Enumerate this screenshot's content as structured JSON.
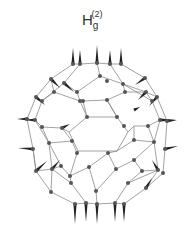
{
  "figure": {
    "title": {
      "base": "H",
      "subscript": "g",
      "superscript": "(2)"
    },
    "molecule": "C60 fullerene vibrational mode",
    "colors": {
      "bond": "#8a8a8a",
      "atom": "#555555",
      "arrow": "#222222",
      "text": "#333333"
    },
    "atoms": [
      [
        73,
        64
      ],
      [
        80,
        64
      ],
      [
        97,
        63
      ],
      [
        110,
        64
      ],
      [
        121,
        64
      ],
      [
        100,
        76
      ],
      [
        51,
        79
      ],
      [
        64,
        83
      ],
      [
        77,
        92
      ],
      [
        107,
        81
      ],
      [
        123,
        84
      ],
      [
        145,
        78
      ],
      [
        36,
        97
      ],
      [
        42,
        101
      ],
      [
        54,
        92
      ],
      [
        80,
        101
      ],
      [
        125,
        92
      ],
      [
        146,
        92
      ],
      [
        157,
        97
      ],
      [
        152,
        101
      ],
      [
        87,
        117
      ],
      [
        117,
        117
      ],
      [
        107,
        100
      ],
      [
        83,
        101
      ],
      [
        27,
        119
      ],
      [
        35,
        120
      ],
      [
        42,
        127
      ],
      [
        62,
        128
      ],
      [
        124,
        126
      ],
      [
        148,
        126
      ],
      [
        160,
        120
      ],
      [
        167,
        121
      ],
      [
        33,
        149
      ],
      [
        49,
        143
      ],
      [
        72,
        141
      ],
      [
        77,
        153
      ],
      [
        108,
        153
      ],
      [
        134,
        140
      ],
      [
        154,
        142
      ],
      [
        165,
        149
      ],
      [
        36,
        171
      ],
      [
        52,
        169
      ],
      [
        70,
        176
      ],
      [
        89,
        167
      ],
      [
        116,
        169
      ],
      [
        142,
        171
      ],
      [
        158,
        170
      ],
      [
        51,
        192
      ],
      [
        71,
        183
      ],
      [
        96,
        191
      ],
      [
        128,
        183
      ],
      [
        146,
        188
      ],
      [
        163,
        173
      ],
      [
        75,
        204
      ],
      [
        86,
        203
      ],
      [
        97,
        204
      ],
      [
        115,
        203
      ],
      [
        124,
        204
      ],
      [
        61,
        166
      ],
      [
        134,
        160
      ]
    ],
    "bonds_ring_hex_center": [
      [
        87,
        117
      ],
      [
        117,
        117
      ],
      [
        128,
        132
      ],
      [
        117,
        151
      ],
      [
        78,
        151
      ],
      [
        69,
        132
      ]
    ],
    "arrows": [
      [
        73,
        64,
        73,
        48
      ],
      [
        80,
        64,
        80,
        50
      ],
      [
        97,
        63,
        97,
        45
      ],
      [
        110,
        64,
        110,
        50
      ],
      [
        121,
        64,
        121,
        48
      ],
      [
        75,
        204,
        75,
        224
      ],
      [
        86,
        203,
        86,
        222
      ],
      [
        97,
        204,
        97,
        224
      ],
      [
        115,
        203,
        115,
        222
      ],
      [
        124,
        204,
        124,
        222
      ],
      [
        27,
        119,
        17,
        119
      ],
      [
        35,
        120,
        25,
        120
      ],
      [
        33,
        149,
        18,
        148
      ],
      [
        160,
        120,
        176,
        120
      ],
      [
        167,
        121,
        177,
        120
      ],
      [
        165,
        149,
        178,
        146
      ],
      [
        36,
        97,
        45,
        105
      ],
      [
        51,
        79,
        60,
        88
      ],
      [
        64,
        83,
        74,
        92
      ],
      [
        146,
        92,
        138,
        100
      ],
      [
        145,
        78,
        135,
        85
      ],
      [
        157,
        97,
        149,
        106
      ],
      [
        52,
        169,
        60,
        160
      ],
      [
        36,
        171,
        47,
        161
      ],
      [
        146,
        188,
        152,
        178
      ],
      [
        158,
        170,
        152,
        160
      ],
      [
        62,
        128,
        70,
        124
      ],
      [
        134,
        110,
        140,
        107
      ]
    ]
  }
}
